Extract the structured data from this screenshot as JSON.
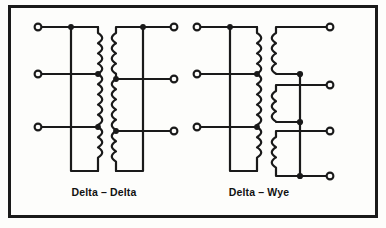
{
  "figure": {
    "background_color": "#fdfdfb",
    "line_color": "#1a1a1a",
    "border": {
      "name": "figure-border",
      "x": 8,
      "y": 5,
      "width": 370,
      "height": 213,
      "stroke_width": 3
    }
  },
  "diagrams": [
    {
      "id": "delta-delta",
      "label": "Delta – Delta",
      "label_x": 104,
      "label_y": 196,
      "primary_type": "delta",
      "secondary_type": "delta",
      "phases": 3,
      "left_terminals": [
        {
          "label": "",
          "x": 38,
          "y": 27
        },
        {
          "label": "",
          "x": 38,
          "y": 74
        },
        {
          "label": "",
          "x": 38,
          "y": 127
        }
      ],
      "right_terminals": [
        {
          "label": "",
          "x": 174,
          "y": 27
        },
        {
          "label": "",
          "x": 174,
          "y": 79
        },
        {
          "label": "",
          "x": 174,
          "y": 131
        }
      ],
      "junction_dots": [
        {
          "x": 71,
          "y": 27
        },
        {
          "x": 98,
          "y": 74
        },
        {
          "x": 98,
          "y": 127
        },
        {
          "x": 143,
          "y": 27
        },
        {
          "x": 116,
          "y": 79
        },
        {
          "x": 116,
          "y": 131
        }
      ]
    },
    {
      "id": "delta-wye",
      "label": "Delta – Wye",
      "label_x": 259,
      "label_y": 196,
      "primary_type": "delta",
      "secondary_type": "wye",
      "phases": 3,
      "left_terminals": [
        {
          "label": "",
          "x": 197,
          "y": 27
        },
        {
          "label": "",
          "x": 197,
          "y": 74
        },
        {
          "label": "",
          "x": 197,
          "y": 127
        }
      ],
      "right_terminals": [
        {
          "label": "",
          "x": 330,
          "y": 27
        },
        {
          "label": "",
          "x": 330,
          "y": 85
        },
        {
          "label": "",
          "x": 330,
          "y": 131
        },
        {
          "label": "",
          "x": 330,
          "y": 176
        }
      ],
      "junction_dots": [
        {
          "x": 230,
          "y": 27
        },
        {
          "x": 257,
          "y": 74
        },
        {
          "x": 257,
          "y": 127
        },
        {
          "x": 300,
          "y": 74
        },
        {
          "x": 300,
          "y": 122
        },
        {
          "x": 300,
          "y": 176
        }
      ],
      "neutral_bus_x": 300
    }
  ],
  "geometry": {
    "terminal_radius": 3.4,
    "dot_radius": 2.8,
    "wire_width": 2.2,
    "coil_width": 2.2,
    "coil_bump_radius": 4.2
  }
}
